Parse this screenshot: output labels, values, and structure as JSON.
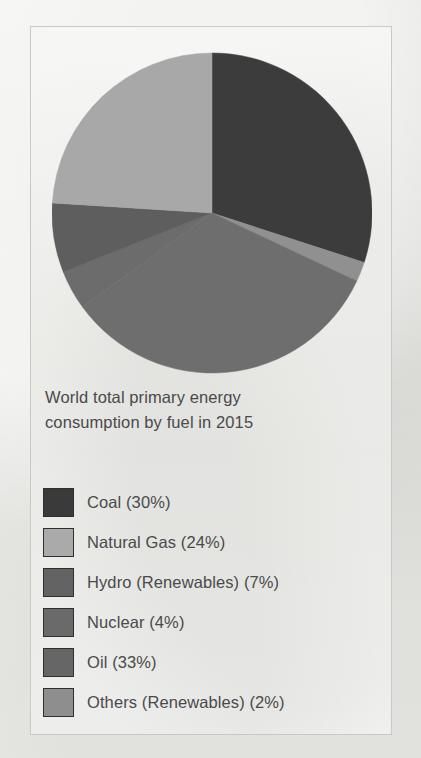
{
  "figure": {
    "caption_line1": "World total primary energy",
    "caption_line2": "consumption by fuel in 2015",
    "background_color": "#f4f4f2",
    "border_color": "#c9c9c6",
    "text_color": "#4a4a4a"
  },
  "chart_data": {
    "type": "pie",
    "title": "World total primary energy consumption by fuel in 2015",
    "xlabel": "",
    "ylabel": "",
    "legend_position": "bottom",
    "grid": false,
    "start_angle_deg": 0,
    "direction": "clockwise",
    "categories": [
      "Coal",
      "Natural Gas",
      "Hydro (Renewables)",
      "Nuclear",
      "Oil",
      "Others (Renewables)"
    ],
    "values": [
      30,
      24,
      7,
      4,
      33,
      2
    ],
    "unit": "%",
    "colors": [
      "#3c3c3c",
      "#a8a8a8",
      "#5e5e5e",
      "#6c6c6c",
      "#6e6e6e",
      "#909090"
    ],
    "slices": [
      {
        "label": "Coal",
        "legend_text": "Coal (30%)",
        "value": 30,
        "color": "#3c3c3c",
        "start_deg": 0,
        "end_deg": 108
      },
      {
        "label": "Others (Renewables)",
        "legend_text": "Others (Renewables) (2%)",
        "value": 2,
        "color": "#909090",
        "start_deg": 108,
        "end_deg": 115.2
      },
      {
        "label": "Oil",
        "legend_text": "Oil (33%)",
        "value": 33,
        "color": "#6e6e6e",
        "start_deg": 115.2,
        "end_deg": 234
      },
      {
        "label": "Nuclear",
        "legend_text": "Nuclear (4%)",
        "value": 4,
        "color": "#6c6c6c",
        "start_deg": 234,
        "end_deg": 248.4
      },
      {
        "label": "Hydro (Renewables)",
        "legend_text": "Hydro (Renewables) (7%)",
        "value": 7,
        "color": "#5e5e5e",
        "start_deg": 248.4,
        "end_deg": 273.6
      },
      {
        "label": "Natural Gas",
        "legend_text": "Natural Gas (24%)",
        "value": 24,
        "color": "#a8a8a8",
        "start_deg": 273.6,
        "end_deg": 360
      }
    ]
  },
  "legend": {
    "items": [
      {
        "label": "Coal (30%)",
        "color": "#3a3a3a"
      },
      {
        "label": "Natural Gas (24%)",
        "color": "#aaaaaa"
      },
      {
        "label": "Hydro (Renewables) (7%)",
        "color": "#636363"
      },
      {
        "label": "Nuclear (4%)",
        "color": "#6a6a6a"
      },
      {
        "label": "Oil (33%)",
        "color": "#666666"
      },
      {
        "label": "Others (Renewables) (2%)",
        "color": "#8e8e8e"
      }
    ]
  }
}
